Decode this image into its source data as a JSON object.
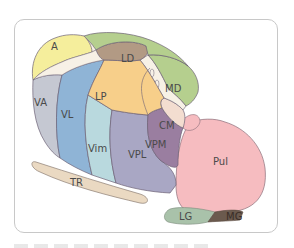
{
  "diagram": {
    "type": "anatomical-diagram",
    "regions": [
      {
        "id": "A",
        "label": "A",
        "color": "#f5ee9c"
      },
      {
        "id": "LD",
        "label": "LD",
        "color": "#b29a84"
      },
      {
        "id": "MD",
        "label": "MD",
        "color": "#b5cf8e"
      },
      {
        "id": "LP",
        "label": "LP",
        "color": "#f7cf8a"
      },
      {
        "id": "VA",
        "label": "VA",
        "color": "#c5c8d2"
      },
      {
        "id": "VL",
        "label": "VL",
        "color": "#8fb4d6"
      },
      {
        "id": "Vim",
        "label": "Vim",
        "color": "#b9d9de"
      },
      {
        "id": "VPL",
        "label": "VPL",
        "color": "#a9a7c4"
      },
      {
        "id": "VPM",
        "label": "VPM",
        "color": "#9a7ea0"
      },
      {
        "id": "CM",
        "label": "CM",
        "color": "#f3ddd0"
      },
      {
        "id": "Pul",
        "label": "Pul",
        "color": "#f6bcc0"
      },
      {
        "id": "LG",
        "label": "LG",
        "color": "#a9c2aa"
      },
      {
        "id": "MG",
        "label": "MG",
        "color": "#6b5a4e"
      },
      {
        "id": "TR",
        "label": "TR",
        "color": "#ead9c2"
      }
    ],
    "outline_color": "#6d6275",
    "frame_border_color": "#c8c8c8"
  }
}
